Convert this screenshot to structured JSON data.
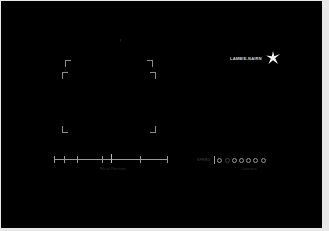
{
  "brand": {
    "name": "LAMBIE-NAIRN",
    "icon": "star-burst-icon"
  },
  "viewfinder": {
    "outer_frame": {
      "left": 65,
      "top": 60,
      "right": 152,
      "bottom": 132
    },
    "inner_frame": {
      "left": 62,
      "top": 72,
      "right": 155,
      "bottom": 132
    }
  },
  "ruler": {
    "label": "Focal Position",
    "ticks_x": [
      0,
      10,
      23,
      48,
      86,
      114
    ],
    "center_marker_x": 57
  },
  "controls": {
    "label": "SPEED",
    "caption": "Controls",
    "dots": [
      {
        "state": "active"
      },
      {
        "state": "dim"
      },
      {
        "state": "active"
      },
      {
        "state": "active"
      },
      {
        "state": "active"
      },
      {
        "state": "active"
      },
      {
        "state": "active"
      }
    ]
  },
  "colors": {
    "background": "#000000",
    "line": "#9a9a9a",
    "frame": "#8a8a8a",
    "margin": "#e8e8e8"
  }
}
